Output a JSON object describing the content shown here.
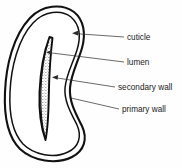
{
  "figure": {
    "background_color": "#fefefe",
    "line_color": "#111111",
    "text_color": "#1a1a1a"
  },
  "labels": [
    {
      "id": "cuticle",
      "text": "cuticle",
      "text_x": 127,
      "text_y": 40,
      "leader_start_x": 124,
      "leader_start_y": 37,
      "leader_end_x": 72,
      "leader_end_y": 33,
      "arrow": "left"
    },
    {
      "id": "lumen",
      "text": "lumen",
      "text_x": 127,
      "text_y": 65,
      "leader_start_x": 124,
      "leader_start_y": 62,
      "leader_end_x": 46,
      "leader_end_y": 52,
      "arrow": "left"
    },
    {
      "id": "secondary-wall",
      "text": "secondary wall",
      "text_x": 118,
      "text_y": 90,
      "leader_start_x": 115,
      "leader_start_y": 87,
      "leader_end_x": 52,
      "leader_end_y": 77,
      "arrow": "left"
    },
    {
      "id": "primary-wall",
      "text": "primary wall",
      "text_x": 122,
      "text_y": 112,
      "leader_start_x": 119,
      "leader_start_y": 109,
      "leader_end_x": 71,
      "leader_end_y": 98,
      "arrow": "none"
    }
  ],
  "shapes": {
    "cuticle_outline_name": "outer cuticle boundary",
    "primary_wall_outline_name": "inner primary wall boundary",
    "lumen_name": "lumen crescent",
    "secondary_wall_name": "stippled secondary wall band"
  }
}
